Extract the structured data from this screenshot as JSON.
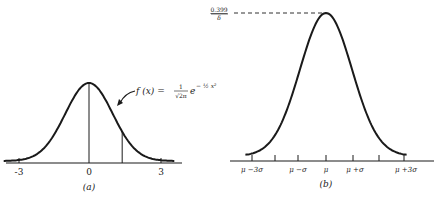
{
  "chart_data": [
    {
      "type": "line",
      "panel": "(a)",
      "title": "",
      "annotation": "f(x) = 1/√(2π) e^(−½x²)",
      "xlabel": "",
      "ylabel": "",
      "x_ticks": [
        "-3",
        "0",
        "3"
      ],
      "xlim": [
        -3.6,
        3.6
      ],
      "series": [
        {
          "name": "standard normal density",
          "x": [
            -3.5,
            -3,
            -2.5,
            -2,
            -1.5,
            -1,
            -0.5,
            0,
            0.5,
            1,
            1.5,
            2,
            2.5,
            3,
            3.5
          ],
          "values": [
            0.0009,
            0.0044,
            0.0175,
            0.054,
            0.1295,
            0.242,
            0.3521,
            0.3989,
            0.3521,
            0.242,
            0.1295,
            0.054,
            0.0175,
            0.0044,
            0.0009
          ]
        }
      ],
      "vertical_lines": [
        0,
        1.4
      ],
      "grid": false
    },
    {
      "type": "line",
      "panel": "(b)",
      "title": "",
      "xlabel": "",
      "ylabel": "",
      "peak_label_numerator": "0.399",
      "peak_label_denominator": "δ",
      "x_ticks": [
        "μ −3σ",
        "",
        "μ −σ",
        "μ",
        "μ +σ",
        "",
        "μ +3σ"
      ],
      "xlim": [
        -3.3,
        3.3
      ],
      "series": [
        {
          "name": "normal density N(μ, σ)",
          "x": [
            -3.3,
            -3,
            -2.5,
            -2,
            -1.5,
            -1,
            -0.5,
            0,
            0.5,
            1,
            1.5,
            2,
            2.5,
            3,
            3.3
          ],
          "values": [
            0.0017,
            0.0044,
            0.0175,
            0.054,
            0.1295,
            0.242,
            0.3521,
            0.3989,
            0.3521,
            0.242,
            0.1295,
            0.054,
            0.0175,
            0.0044,
            0.0017
          ]
        }
      ],
      "grid": false
    }
  ],
  "panel_a": {
    "caption": "(a)",
    "tick_labels": [
      "-3",
      "0",
      "3"
    ],
    "formula": {
      "lhs": "f (x) =",
      "numerator": "1",
      "denominator": "√2π",
      "base": "e",
      "exponent": "− ½ x²"
    }
  },
  "panel_b": {
    "caption": "(b)",
    "peak_numerator": "0.399",
    "peak_denominator": "δ",
    "tick_labels": [
      "μ −3σ",
      "μ −σ",
      "μ",
      "μ +σ",
      "μ +3σ"
    ]
  }
}
